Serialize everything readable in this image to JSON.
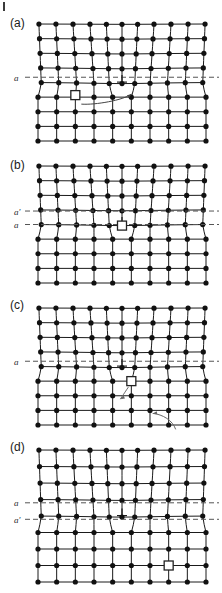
{
  "figure": {
    "corner_tick": "page-edge-tick",
    "panels": [
      {
        "id": "a",
        "label": "(a)",
        "slip_lines": [
          {
            "left_label": "a",
            "right_label": "b",
            "y": 0.455
          }
        ],
        "dislocation_symbol": "⊥",
        "dislocation_column": 5,
        "square_marker": {
          "col": 2,
          "row_below": 1
        },
        "arrows": 1
      },
      {
        "id": "b",
        "label": "(b)",
        "slip_lines": [
          {
            "left_label": "a′",
            "right_label": "b′",
            "y": 0.385
          },
          {
            "left_label": "a",
            "right_label": "b",
            "y": 0.5
          }
        ],
        "dislocation_symbol": "⊥",
        "dislocation_column": 5,
        "square_marker": {
          "col": 5,
          "row_below": 0
        },
        "arrows": 0
      },
      {
        "id": "c",
        "label": "(c)",
        "slip_lines": [
          {
            "left_label": "a",
            "right_label": "b",
            "y": 0.455
          }
        ],
        "dislocation_symbol": "⊥",
        "dislocation_column": 5,
        "square_marker": {
          "col": 5,
          "row_below": 1
        },
        "arrows": 2
      },
      {
        "id": "d",
        "label": "(d)",
        "slip_lines": [
          {
            "left_label": "a",
            "right_label": "b",
            "y": 0.4
          },
          {
            "left_label": "a′",
            "right_label": "b′",
            "y": 0.525
          }
        ],
        "dislocation_symbol": "⊥",
        "dislocation_column": 5,
        "square_marker": {
          "col": 7,
          "row_below": 3
        },
        "arrows": 0
      }
    ],
    "lattice": {
      "columns_upper": 11,
      "columns_lower": 10,
      "rows": 9,
      "atom_color": "#111111",
      "bond_color": "#1a1a1a",
      "dashed_color": "#555555",
      "marker_color": "#222222"
    }
  }
}
